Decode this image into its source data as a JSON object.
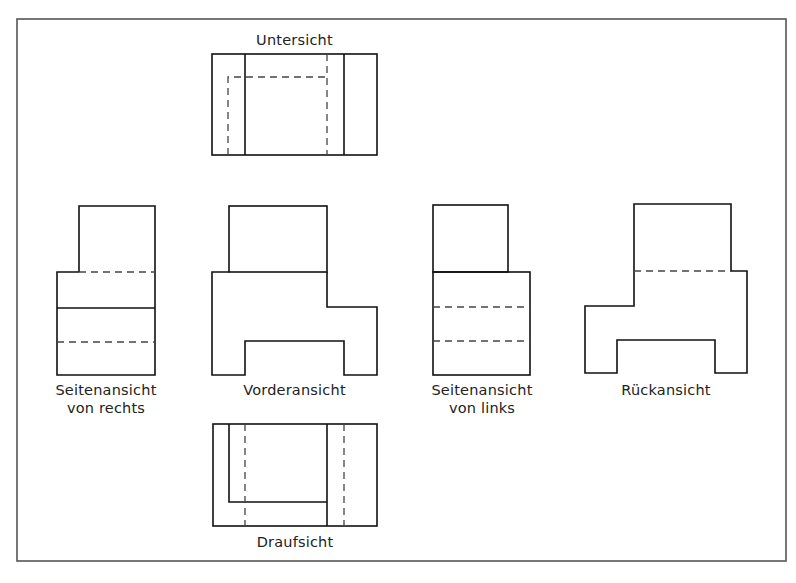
{
  "diagram": {
    "stroke_color": "#111111",
    "hidden_line_color": "#444444",
    "views": {
      "untersicht": {
        "label": "Untersicht"
      },
      "seite_rechts": {
        "label_line1": "Seitenansicht",
        "label_line2": "von rechts"
      },
      "vorderansicht": {
        "label": "Vorderansicht"
      },
      "seite_links": {
        "label_line1": "Seitenansicht",
        "label_line2": "von links"
      },
      "rueckansicht": {
        "label": "Rückansicht"
      },
      "draufsicht": {
        "label": "Draufsicht"
      }
    }
  }
}
